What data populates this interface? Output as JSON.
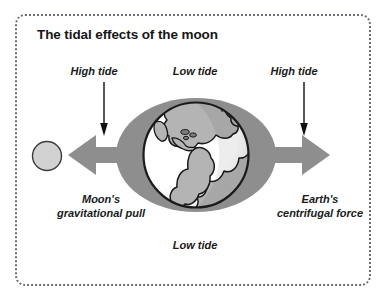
{
  "figure": {
    "title": "The tidal effects of the moon",
    "border_style": "dotted-rounded-rectangle",
    "background_color": "#ffffff"
  },
  "labels": {
    "high_tide_left": "High tide",
    "low_tide_top": "Low tide",
    "high_tide_right": "High tide",
    "low_tide_bottom": "Low tide",
    "moons_gravitational_pull": "Moon's gravitational pull",
    "earths_centrifugal_force": "Earth's centrifugal force"
  },
  "diagram": {
    "type": "labelled-science-diagram",
    "elements": [
      {
        "name": "moon",
        "shape": "circle",
        "fill": "#d2d2d2",
        "stroke": "#3a3a3a",
        "center": [
          47,
          156
        ],
        "radius": 15
      },
      {
        "name": "tidal-bulge-ellipse",
        "shape": "ellipse",
        "fill": "#8e8e8e",
        "center": [
          196,
          155
        ],
        "rx": 80,
        "ry": 57
      },
      {
        "name": "earth-globe",
        "shape": "circle",
        "ocean_fill": "#ffffff",
        "land_fill": "#b4b4b4",
        "stroke": "#1a1a1a",
        "center": [
          196,
          155
        ],
        "radius": 53
      },
      {
        "name": "moon-pull-arrow",
        "shape": "thick-block-arrow",
        "direction": "left",
        "fill": "#8e8e8e"
      },
      {
        "name": "centrifugal-force-arrow",
        "shape": "thick-block-arrow",
        "direction": "right",
        "fill": "#8e8e8e"
      },
      {
        "name": "high-tide-pointer-left",
        "shape": "thin-arrow",
        "direction": "down",
        "stroke": "#111111"
      },
      {
        "name": "high-tide-pointer-right",
        "shape": "thin-arrow",
        "direction": "down",
        "stroke": "#111111"
      }
    ]
  },
  "colors": {
    "bulge_gray": "#8e8e8e",
    "land_gray": "#b4b4b4",
    "moon_gray": "#d2d2d2",
    "outline_black": "#1a1a1a",
    "border_gray": "#6d6d75"
  }
}
